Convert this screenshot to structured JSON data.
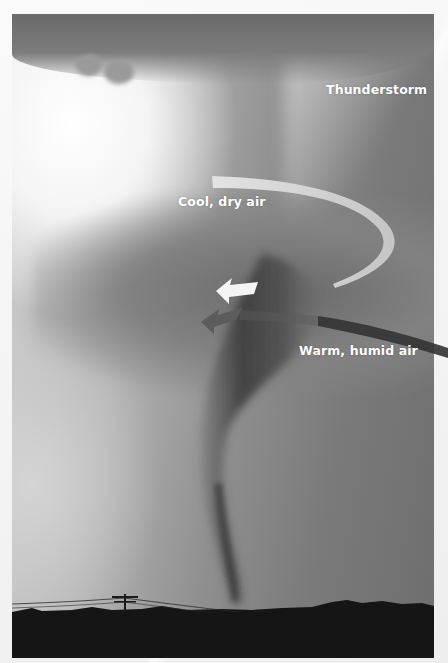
{
  "figure": {
    "labels": {
      "thunderstorm": "Thunderstorm",
      "cool_dry_air": "Cool, dry air",
      "warm_humid_air": "Warm, humid air"
    },
    "colors": {
      "cool_air_arrow": "#d6d6d6",
      "cool_air_arrowhead": "#f2f2f2",
      "warm_air_arrow": "#3a3a3a",
      "warm_air_arrowhead": "#5a5a5a",
      "label_text": "#ffffff",
      "ground": "#151515"
    }
  }
}
